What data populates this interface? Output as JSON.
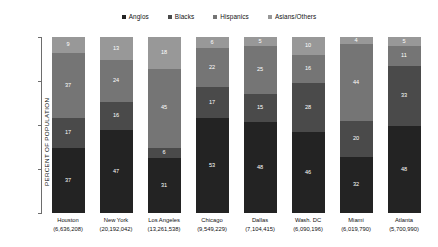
{
  "chart_data": {
    "type": "bar",
    "subtype": "stacked-bar-100",
    "title": "",
    "xlabel": "",
    "ylabel": "PERCENT OF POPULATION",
    "ylim": [
      0,
      100
    ],
    "yticks": [
      0,
      25,
      50,
      75,
      100
    ],
    "ytick_labels": [
      "0",
      "25",
      "50",
      "75",
      "100"
    ],
    "grid": false,
    "legend_position": "top-center",
    "categories": [
      "Houston",
      "New York",
      "Los Angeles",
      "Chicago",
      "Dallas",
      "Wash. DC",
      "Miami",
      "Atlanta"
    ],
    "category_sublabels": [
      "(6,636,208)",
      "(20,192,042)",
      "(13,261,538)",
      "(9,549,229)",
      "(7,104,415)",
      "(6,090,196)",
      "(6,019,790)",
      "(5,700,990)"
    ],
    "series": [
      {
        "name": "Anglos",
        "color": "#232323",
        "values": [
          37,
          47,
          31,
          53,
          48,
          46,
          32,
          48
        ]
      },
      {
        "name": "Blacks",
        "color": "#4a4a4a",
        "values": [
          17,
          16,
          6,
          17,
          15,
          28,
          20,
          33
        ]
      },
      {
        "name": "Hispanics",
        "color": "#757575",
        "values": [
          37,
          24,
          45,
          22,
          25,
          16,
          44,
          11
        ]
      },
      {
        "name": "Asians/Others",
        "color": "#989898",
        "values": [
          9,
          13,
          18,
          6,
          5,
          10,
          4,
          5
        ]
      }
    ]
  },
  "legend": {
    "items": [
      {
        "label": "Anglos",
        "color": "#232323"
      },
      {
        "label": "Blacks",
        "color": "#4a4a4a"
      },
      {
        "label": "Hispanics",
        "color": "#757575"
      },
      {
        "label": "Asians/Others",
        "color": "#989898"
      }
    ]
  },
  "axis": {
    "y_title": "PERCENT OF POPULATION",
    "y_ticks": [
      "100",
      "75",
      "50",
      "25",
      "0"
    ]
  }
}
